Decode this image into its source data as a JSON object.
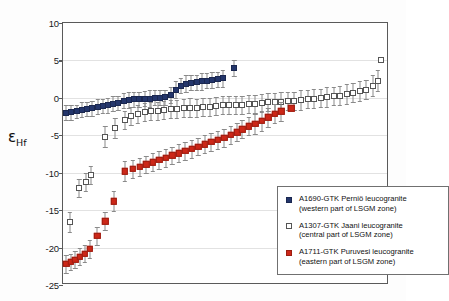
{
  "chart_data": {
    "type": "scatter",
    "title": "",
    "xlabel": "",
    "ylabel": "εHf",
    "ylabel_main": "ε",
    "ylabel_sub": "Hf",
    "ylim": [
      -25,
      10
    ],
    "yticks": [
      10,
      5,
      0,
      -5,
      -10,
      -15,
      -20,
      -25
    ],
    "ytick_labels": [
      "10",
      "5",
      "0",
      "-5",
      "-10",
      "-15",
      "-20",
      "-25"
    ],
    "xlim": [
      0,
      100
    ],
    "xticks": [],
    "xtick_labels": [],
    "grid": true,
    "errorbars": true,
    "legend_position": "lower-right",
    "colors": {
      "navy": "#23356b",
      "white": "#ffffff",
      "red": "#cc2718",
      "errorbar": "#8a8a8a",
      "frame": "#5a5a5a",
      "gridline": "#e2e2e2"
    },
    "series": [
      {
        "name": "A1690-GTK Perniö leucogranite",
        "subtitle": "(western part of LSGM zone)",
        "marker": "filled-square",
        "color": "#23356b",
        "points": [
          {
            "x": 1.0,
            "y": -2.0,
            "err": 1.0
          },
          {
            "x": 2.6,
            "y": -1.9,
            "err": 1.0
          },
          {
            "x": 4.2,
            "y": -1.8,
            "err": 0.9
          },
          {
            "x": 5.8,
            "y": -1.6,
            "err": 1.0
          },
          {
            "x": 7.4,
            "y": -1.5,
            "err": 0.9
          },
          {
            "x": 9.0,
            "y": -1.4,
            "err": 1.0
          },
          {
            "x": 10.6,
            "y": -1.2,
            "err": 1.0
          },
          {
            "x": 12.2,
            "y": -1.1,
            "err": 0.9
          },
          {
            "x": 13.8,
            "y": -1.0,
            "err": 1.0
          },
          {
            "x": 15.4,
            "y": -0.8,
            "err": 1.0
          },
          {
            "x": 17.0,
            "y": -0.7,
            "err": 0.9
          },
          {
            "x": 18.6,
            "y": -0.4,
            "err": 1.0
          },
          {
            "x": 20.2,
            "y": -0.3,
            "err": 1.1
          },
          {
            "x": 21.8,
            "y": -0.2,
            "err": 1.0
          },
          {
            "x": 23.4,
            "y": -0.2,
            "err": 1.0
          },
          {
            "x": 25.0,
            "y": -0.1,
            "err": 1.0
          },
          {
            "x": 26.6,
            "y": -0.1,
            "err": 1.1
          },
          {
            "x": 28.2,
            "y": 0.0,
            "err": 1.0
          },
          {
            "x": 29.8,
            "y": 0.0,
            "err": 1.0
          },
          {
            "x": 31.4,
            "y": 0.1,
            "err": 1.0
          },
          {
            "x": 33.0,
            "y": 0.4,
            "err": 1.1
          },
          {
            "x": 34.6,
            "y": 1.1,
            "err": 1.1
          },
          {
            "x": 36.2,
            "y": 1.6,
            "err": 1.0
          },
          {
            "x": 37.8,
            "y": 1.9,
            "err": 1.1
          },
          {
            "x": 39.4,
            "y": 2.0,
            "err": 1.0
          },
          {
            "x": 41.0,
            "y": 2.1,
            "err": 1.0
          },
          {
            "x": 42.6,
            "y": 2.2,
            "err": 1.1
          },
          {
            "x": 44.2,
            "y": 2.3,
            "err": 1.0
          },
          {
            "x": 45.8,
            "y": 2.4,
            "err": 1.1
          },
          {
            "x": 47.4,
            "y": 2.5,
            "err": 1.0
          },
          {
            "x": 49.0,
            "y": 2.6,
            "err": 1.1
          },
          {
            "x": 52.5,
            "y": 4.0,
            "err": 1.1
          }
        ]
      },
      {
        "name": "A1307-GTK Jaani leucogranite",
        "subtitle": "(central part of LSGM zone)",
        "marker": "open-square",
        "color": "#ffffff",
        "points": [
          {
            "x": 2.0,
            "y": -16.6,
            "err": 1.3
          },
          {
            "x": 5.0,
            "y": -12.1,
            "err": 1.2
          },
          {
            "x": 7.0,
            "y": -11.3,
            "err": 1.2
          },
          {
            "x": 8.6,
            "y": -10.3,
            "err": 1.2
          },
          {
            "x": 13.0,
            "y": -5.2,
            "err": 1.4
          },
          {
            "x": 16.0,
            "y": -4.0,
            "err": 1.3
          },
          {
            "x": 19.0,
            "y": -2.9,
            "err": 1.2
          },
          {
            "x": 21.0,
            "y": -2.4,
            "err": 1.2
          },
          {
            "x": 23.0,
            "y": -2.1,
            "err": 1.2
          },
          {
            "x": 25.0,
            "y": -1.9,
            "err": 1.2
          },
          {
            "x": 27.0,
            "y": -1.8,
            "err": 1.2
          },
          {
            "x": 29.0,
            "y": -1.7,
            "err": 1.2
          },
          {
            "x": 31.0,
            "y": -1.6,
            "err": 1.2
          },
          {
            "x": 33.0,
            "y": -1.5,
            "err": 1.2
          },
          {
            "x": 35.0,
            "y": -1.5,
            "err": 1.2
          },
          {
            "x": 37.0,
            "y": -1.4,
            "err": 1.2
          },
          {
            "x": 39.0,
            "y": -1.3,
            "err": 1.3
          },
          {
            "x": 41.0,
            "y": -1.3,
            "err": 1.2
          },
          {
            "x": 43.0,
            "y": -1.2,
            "err": 1.2
          },
          {
            "x": 45.0,
            "y": -1.2,
            "err": 1.2
          },
          {
            "x": 47.0,
            "y": -1.1,
            "err": 1.2
          },
          {
            "x": 49.0,
            "y": -1.0,
            "err": 1.2
          },
          {
            "x": 51.0,
            "y": -1.0,
            "err": 1.2
          },
          {
            "x": 53.0,
            "y": -0.9,
            "err": 1.2
          },
          {
            "x": 55.0,
            "y": -0.9,
            "err": 1.2
          },
          {
            "x": 57.0,
            "y": -0.8,
            "err": 1.2
          },
          {
            "x": 59.0,
            "y": -0.8,
            "err": 1.2
          },
          {
            "x": 61.0,
            "y": -0.7,
            "err": 1.2
          },
          {
            "x": 63.0,
            "y": -0.6,
            "err": 1.2
          },
          {
            "x": 65.0,
            "y": -0.6,
            "err": 1.2
          },
          {
            "x": 67.0,
            "y": -0.5,
            "err": 1.3
          },
          {
            "x": 69.0,
            "y": -0.4,
            "err": 1.2
          },
          {
            "x": 71.0,
            "y": -0.4,
            "err": 1.2
          },
          {
            "x": 73.0,
            "y": -0.3,
            "err": 1.3
          },
          {
            "x": 75.0,
            "y": -0.2,
            "err": 1.2
          },
          {
            "x": 77.0,
            "y": -0.1,
            "err": 1.3
          },
          {
            "x": 79.0,
            "y": 0.0,
            "err": 1.2
          },
          {
            "x": 81.0,
            "y": 0.1,
            "err": 1.3
          },
          {
            "x": 83.0,
            "y": 0.2,
            "err": 1.2
          },
          {
            "x": 85.0,
            "y": 0.3,
            "err": 1.3
          },
          {
            "x": 87.0,
            "y": 0.5,
            "err": 1.3
          },
          {
            "x": 89.0,
            "y": 0.7,
            "err": 1.3
          },
          {
            "x": 91.0,
            "y": 0.9,
            "err": 1.3
          },
          {
            "x": 93.0,
            "y": 1.1,
            "err": 1.3
          },
          {
            "x": 95.0,
            "y": 1.6,
            "err": 1.4
          },
          {
            "x": 96.5,
            "y": 2.3,
            "err": 1.4
          },
          {
            "x": 97.5,
            "y": 5.1,
            "err": 0.0
          }
        ]
      },
      {
        "name": "A1711-GTK Puruvesi leucogranite",
        "subtitle": "(eastern part of LSGM zone)",
        "marker": "filled-square",
        "color": "#cc2718",
        "points": [
          {
            "x": 1.0,
            "y": -22.2,
            "err": 1.2
          },
          {
            "x": 2.4,
            "y": -21.9,
            "err": 1.1
          },
          {
            "x": 3.8,
            "y": -21.6,
            "err": 1.1
          },
          {
            "x": 5.2,
            "y": -21.2,
            "err": 1.1
          },
          {
            "x": 6.6,
            "y": -20.8,
            "err": 1.1
          },
          {
            "x": 8.2,
            "y": -20.2,
            "err": 1.2
          },
          {
            "x": 10.5,
            "y": -18.4,
            "err": 1.2
          },
          {
            "x": 13.0,
            "y": -16.5,
            "err": 1.2
          },
          {
            "x": 15.5,
            "y": -13.8,
            "err": 1.3
          },
          {
            "x": 19.0,
            "y": -9.8,
            "err": 1.3
          },
          {
            "x": 21.5,
            "y": -9.5,
            "err": 1.2
          },
          {
            "x": 23.5,
            "y": -9.2,
            "err": 1.2
          },
          {
            "x": 25.5,
            "y": -8.9,
            "err": 1.2
          },
          {
            "x": 27.5,
            "y": -8.6,
            "err": 1.2
          },
          {
            "x": 29.5,
            "y": -8.3,
            "err": 1.2
          },
          {
            "x": 31.5,
            "y": -8.0,
            "err": 1.2
          },
          {
            "x": 33.5,
            "y": -7.7,
            "err": 1.2
          },
          {
            "x": 35.5,
            "y": -7.4,
            "err": 1.2
          },
          {
            "x": 37.5,
            "y": -7.1,
            "err": 1.2
          },
          {
            "x": 39.5,
            "y": -6.8,
            "err": 1.2
          },
          {
            "x": 41.5,
            "y": -6.5,
            "err": 1.2
          },
          {
            "x": 43.5,
            "y": -6.2,
            "err": 1.2
          },
          {
            "x": 45.5,
            "y": -5.9,
            "err": 1.2
          },
          {
            "x": 47.5,
            "y": -5.6,
            "err": 1.2
          },
          {
            "x": 49.5,
            "y": -5.3,
            "err": 1.2
          },
          {
            "x": 51.5,
            "y": -4.9,
            "err": 1.2
          },
          {
            "x": 53.5,
            "y": -4.6,
            "err": 1.2
          },
          {
            "x": 55.0,
            "y": -4.2,
            "err": 1.2
          },
          {
            "x": 57.0,
            "y": -3.8,
            "err": 1.2
          },
          {
            "x": 59.0,
            "y": -3.5,
            "err": 1.3
          },
          {
            "x": 61.0,
            "y": -3.1,
            "err": 1.3
          },
          {
            "x": 63.0,
            "y": -2.6,
            "err": 1.3
          },
          {
            "x": 65.0,
            "y": -2.1,
            "err": 1.3
          },
          {
            "x": 67.0,
            "y": -1.8,
            "err": 1.3
          },
          {
            "x": 70.0,
            "y": -1.4,
            "err": 0.0
          }
        ]
      }
    ]
  },
  "legend": {
    "entries": [
      {
        "marker_class": "lm-navy",
        "line1": "A1690-GTK Perniö leucogranite",
        "line2": "(western part of LSGM zone)"
      },
      {
        "marker_class": "lm-white",
        "line1": "A1307-GTK Jaani leucogranite",
        "line2": "(central part of LSGM zone)"
      },
      {
        "marker_class": "lm-red",
        "line1": "A1711-GTK Puruvesi leucogranite",
        "line2": "(eastern part of LSGM zone)"
      }
    ]
  }
}
